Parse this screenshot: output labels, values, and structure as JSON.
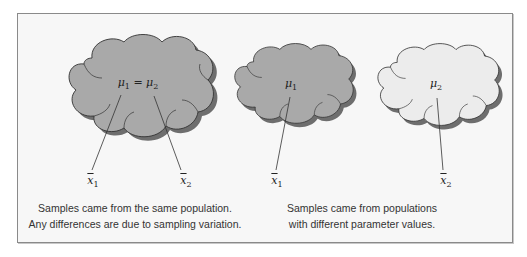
{
  "figure": {
    "panels": [
      {
        "id": "same-population",
        "clouds": [
          {
            "label_parts": [
              "μ",
              "1",
              " = μ",
              "2"
            ],
            "fill": "#a9a9a9"
          }
        ],
        "samples": [
          {
            "symbol": "x",
            "sub": "1"
          },
          {
            "symbol": "x",
            "sub": "2"
          }
        ],
        "caption_lines": [
          "Samples came from the same population.",
          "Any differences are due to sampling variation."
        ]
      },
      {
        "id": "different-populations",
        "clouds": [
          {
            "label_parts": [
              "μ",
              "1"
            ],
            "fill": "#a9a9a9"
          },
          {
            "label_parts": [
              "μ",
              "2"
            ],
            "fill": "#ececec"
          }
        ],
        "samples": [
          {
            "symbol": "x",
            "sub": "1"
          },
          {
            "symbol": "x",
            "sub": "2"
          }
        ],
        "caption_lines": [
          "Samples came from populations",
          "with different parameter values."
        ]
      }
    ],
    "colors": {
      "frame_bg": "#f7f7f7",
      "frame_border": "#8a8a8a",
      "dark_cloud": "#a9a9a9",
      "light_cloud": "#ececec",
      "shadow": "#6e6e6e",
      "outline": "#333333"
    }
  }
}
